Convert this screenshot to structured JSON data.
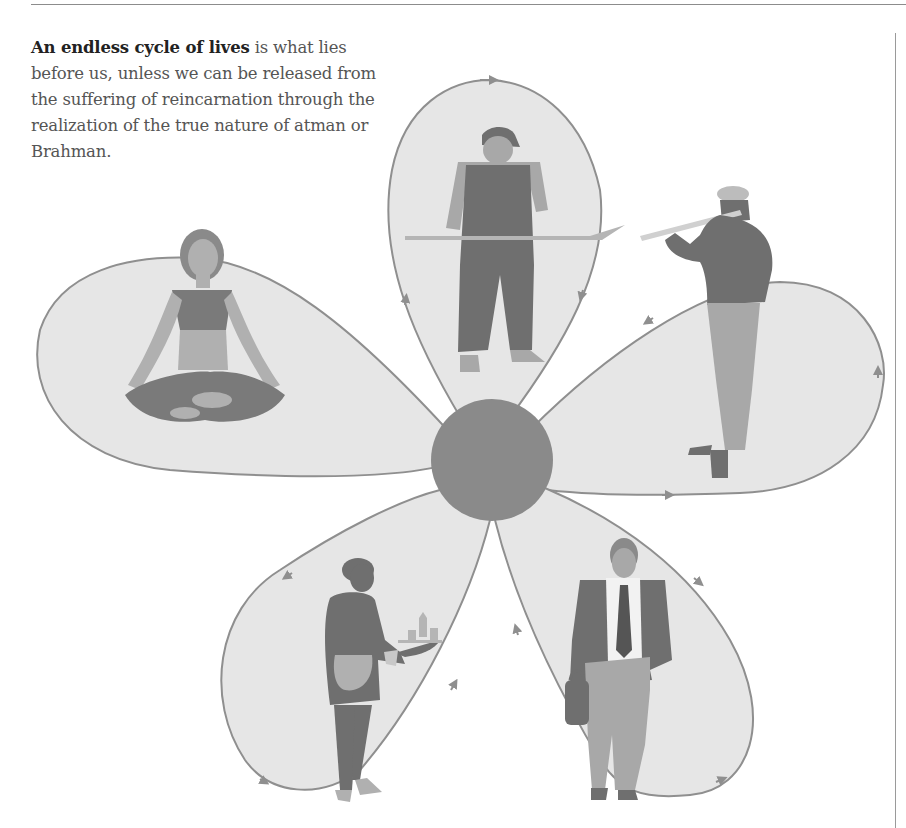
{
  "caption": {
    "bold": "An endless cycle of lives",
    "rest": " is what lies before us, unless we can be released from the suffering of reincarnation through the realization of the true nature of atman or Brahman."
  },
  "diagram": {
    "type": "cycle-of-rebirth",
    "center": {
      "label": "center-circle",
      "color": "#8a8a8a"
    },
    "petal_fill": "#e6e6e6",
    "petal_stroke": "#8f8f8f",
    "figure_dark": "#7a7a7a",
    "figure_mid": "#a3a3a3",
    "figure_light": "#c2c2c2",
    "petals": [
      {
        "name": "laborer-with-shovel",
        "position": "top"
      },
      {
        "name": "flute-player",
        "position": "right"
      },
      {
        "name": "businessman-with-bag",
        "position": "bottom-right"
      },
      {
        "name": "waitress-with-tray",
        "position": "bottom-left"
      },
      {
        "name": "meditating-woman",
        "position": "left"
      }
    ]
  }
}
